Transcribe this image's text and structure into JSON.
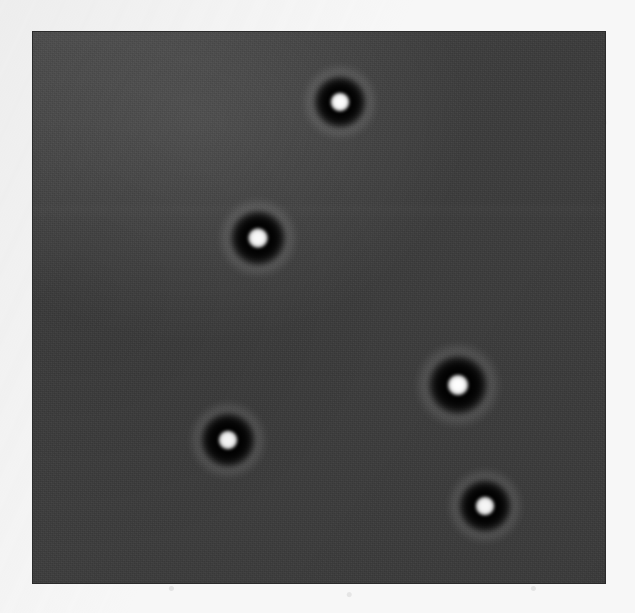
{
  "document": {
    "kind": "micrograph-figure",
    "page_background_color": "#f7f7f7",
    "caption": ""
  },
  "panel": {
    "label": "micrograph",
    "x": 33,
    "y": 32,
    "width": 572,
    "height": 551,
    "background_color": "#3d3d3d",
    "border_color": "#2b2b2b",
    "modality": "phase-contrast / in-line holographic microscopy",
    "illumination_note": "diffuse diagonal bright band across upper-left of field"
  },
  "chart_data": {
    "type": "scatter",
    "title": "",
    "subtitle": "",
    "xlabel": "",
    "ylabel": "",
    "xlim": [
      0,
      572
    ],
    "ylim": [
      0,
      551
    ],
    "grid": false,
    "legend": "none",
    "units": "pixels (panel-relative)",
    "annotations": [],
    "tick_labels": {
      "x": [],
      "y": []
    },
    "series": [
      {
        "name": "particles",
        "marker": "bright-core-dark-ring",
        "count": 5,
        "x": [
          307,
          225,
          425,
          195,
          452
        ],
        "y": [
          70,
          206,
          353,
          408,
          474
        ],
        "points": [
          {
            "id": "particle-1",
            "label": "top-center",
            "cx": 307,
            "cy": 70,
            "core_d": 21,
            "ring_d": 55,
            "halo_d": 78,
            "brightness": 1.0
          },
          {
            "id": "particle-2",
            "label": "upper-left",
            "cx": 225,
            "cy": 206,
            "core_d": 22,
            "ring_d": 58,
            "halo_d": 82,
            "brightness": 0.98
          },
          {
            "id": "particle-3",
            "label": "right-middle",
            "cx": 425,
            "cy": 353,
            "core_d": 23,
            "ring_d": 62,
            "halo_d": 88,
            "brightness": 1.0
          },
          {
            "id": "particle-4",
            "label": "lower-left",
            "cx": 195,
            "cy": 408,
            "core_d": 21,
            "ring_d": 57,
            "halo_d": 80,
            "brightness": 0.96
          },
          {
            "id": "particle-5",
            "label": "bottom-right",
            "cx": 452,
            "cy": 474,
            "core_d": 21,
            "ring_d": 55,
            "halo_d": 78,
            "brightness": 0.97
          }
        ]
      }
    ]
  },
  "colors": {
    "field": "#3d3d3d",
    "core": "#ffffff",
    "ring": "#000000",
    "halo": "#6e6e6e",
    "page": "#f7f7f7"
  }
}
